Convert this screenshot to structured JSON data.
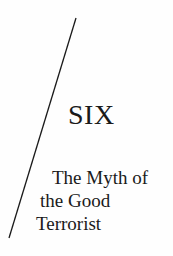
{
  "chapter": {
    "number_label": "SIX",
    "title_lines": [
      "The Myth of",
      "the Good",
      "Terrorist"
    ]
  },
  "decoration": {
    "diagonal_rule": {
      "x1": 76,
      "y1": 18,
      "x2": 9,
      "y2": 238,
      "color": "#1a1a1a"
    }
  }
}
